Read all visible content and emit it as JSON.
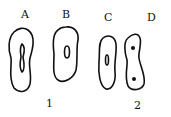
{
  "figure": {
    "cells": [
      {
        "label": "A",
        "nucleus": "elongated-constricted"
      },
      {
        "label": "B",
        "nucleus": "oval"
      },
      {
        "label": "C",
        "nucleus": "elongated"
      },
      {
        "label": "D",
        "nucleus": "two-dots"
      }
    ],
    "groups": [
      {
        "label": "1",
        "members": [
          "A",
          "B"
        ]
      },
      {
        "label": "2",
        "members": [
          "C",
          "D"
        ]
      }
    ]
  }
}
